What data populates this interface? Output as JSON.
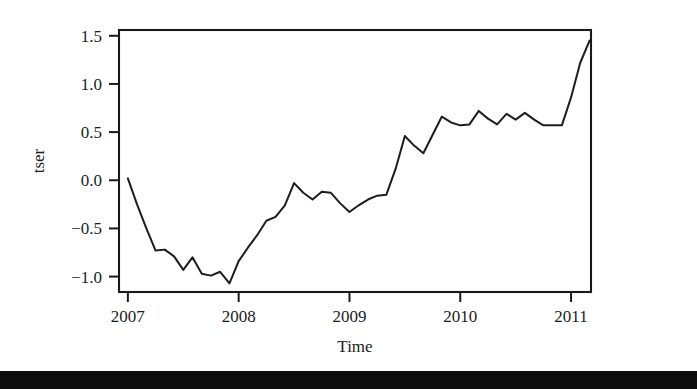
{
  "figure": {
    "caption_area": "",
    "background_color": "#ffffff",
    "line_color": "#1d1d1d",
    "axis_color": "#1a1a1a"
  },
  "chart_data": {
    "type": "line",
    "title": "",
    "xlabel": "Time",
    "ylabel": "tser",
    "xlim": [
      2006.92,
      2011.18
    ],
    "ylim": [
      -1.16,
      1.56
    ],
    "xticks": [
      2007,
      2008,
      2009,
      2010,
      2011
    ],
    "xtick_labels": [
      "2007",
      "2008",
      "2009",
      "2010",
      "2011"
    ],
    "yticks": [
      -1.0,
      -0.5,
      0.0,
      0.5,
      1.0,
      1.5
    ],
    "ytick_labels": [
      "-1.0",
      "-0.5",
      "0.0",
      "0.5",
      "1.0",
      "1.5"
    ],
    "grid": false,
    "legend": false,
    "legend_position": "none",
    "series": [
      {
        "name": "tser",
        "x": [
          2007.0,
          2007.083,
          2007.167,
          2007.25,
          2007.333,
          2007.417,
          2007.5,
          2007.583,
          2007.667,
          2007.75,
          2007.833,
          2007.917,
          2008.0,
          2008.083,
          2008.167,
          2008.25,
          2008.333,
          2008.417,
          2008.5,
          2008.583,
          2008.667,
          2008.75,
          2008.833,
          2008.917,
          2009.0,
          2009.083,
          2009.167,
          2009.25,
          2009.333,
          2009.417,
          2009.5,
          2009.583,
          2009.667,
          2009.75,
          2009.833,
          2009.917,
          2010.0,
          2010.083,
          2010.167,
          2010.25,
          2010.333,
          2010.417,
          2010.5,
          2010.583,
          2010.667,
          2010.75,
          2010.833,
          2010.917,
          2011.0,
          2011.083,
          2011.167
        ],
        "y": [
          0.02,
          -0.25,
          -0.5,
          -0.73,
          -0.72,
          -0.79,
          -0.93,
          -0.8,
          -0.97,
          -0.99,
          -0.95,
          -1.07,
          -0.84,
          -0.7,
          -0.57,
          -0.42,
          -0.38,
          -0.26,
          -0.03,
          -0.13,
          -0.2,
          -0.12,
          -0.13,
          -0.24,
          -0.33,
          -0.26,
          -0.2,
          -0.16,
          -0.15,
          0.12,
          0.46,
          0.36,
          0.28,
          0.47,
          0.66,
          0.6,
          0.57,
          0.58,
          0.72,
          0.64,
          0.58,
          0.69,
          0.63,
          0.7,
          0.63,
          0.57,
          0.57,
          0.57,
          0.86,
          1.22,
          1.45
        ]
      }
    ]
  }
}
